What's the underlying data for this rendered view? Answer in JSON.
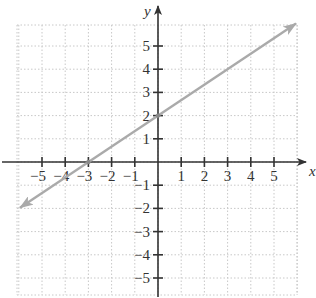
{
  "chart_data": {
    "type": "line",
    "title": "",
    "xlabel": "x",
    "ylabel": "y",
    "xlim": [
      -6,
      6
    ],
    "ylim": [
      -6,
      6
    ],
    "grid": true,
    "grid_style": "dotted",
    "x_ticks": [
      -5,
      -4,
      -3,
      -2,
      -1,
      1,
      2,
      3,
      4,
      5
    ],
    "y_ticks": [
      -5,
      -4,
      -3,
      -2,
      -1,
      1,
      2,
      3,
      4,
      5
    ],
    "x_tick_labels": [
      "−5",
      "−4",
      "−3",
      "−2",
      "−1",
      "1",
      "2",
      "3",
      "4",
      "5"
    ],
    "y_tick_labels": [
      "−5",
      "−4",
      "−3",
      "−2",
      "−1",
      "1",
      "2",
      "3",
      "4",
      "5"
    ],
    "series": [
      {
        "name": "y = (2/3)x + 2",
        "equation": "y = (2/3)x + 2",
        "slope": 0.6667,
        "y_intercept": 2,
        "x_intercept": -3,
        "x": [
          -6,
          -3,
          0,
          6
        ],
        "y": [
          -2,
          0,
          2,
          6
        ],
        "marked_points": [
          [
            -3,
            0
          ],
          [
            0,
            2
          ]
        ],
        "arrows_both_ends": true,
        "color": "#aaaaaa"
      }
    ],
    "legend": null
  },
  "axes": {
    "x_label": "x",
    "y_label": "y",
    "axis_color": "#333333",
    "grid_color": "#c8c8c8",
    "line_color": "#aaaaaa"
  }
}
